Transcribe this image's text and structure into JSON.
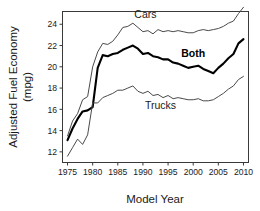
{
  "chart_data": {
    "type": "line",
    "title": "",
    "xlabel": "Model Year",
    "ylabel": "Adjusted Fuel Economy (mpg)",
    "ylabel_line1": "Adjusted Fuel Economy",
    "ylabel_line2": "(mpg)",
    "xlim": [
      1974,
      2011
    ],
    "ylim": [
      11,
      25.2
    ],
    "grid": false,
    "legend_position": "inline-annotations",
    "xticks": [
      1975,
      1980,
      1985,
      1990,
      1995,
      2000,
      2005,
      2010
    ],
    "xtick_labels": [
      "1975",
      "1980",
      "1985",
      "1990",
      "1995",
      "2000",
      "2005",
      "2010"
    ],
    "yticks": [
      12,
      14,
      16,
      18,
      20,
      22,
      24
    ],
    "ytick_labels": [
      "12",
      "14",
      "16",
      "18",
      "20",
      "22",
      "24"
    ],
    "x": [
      1975,
      1976,
      1977,
      1978,
      1979,
      1980,
      1981,
      1982,
      1983,
      1984,
      1985,
      1986,
      1987,
      1988,
      1989,
      1990,
      1991,
      1992,
      1993,
      1994,
      1995,
      1996,
      1997,
      1998,
      1999,
      2000,
      2001,
      2002,
      2003,
      2004,
      2005,
      2006,
      2007,
      2008,
      2009,
      2010
    ],
    "series": [
      {
        "name": "Cars",
        "label": "Cars",
        "color": "#4a4a4a",
        "emphasis": false,
        "values": [
          13.5,
          14.9,
          15.6,
          16.9,
          17.2,
          20.0,
          21.4,
          22.2,
          22.1,
          22.4,
          23.0,
          23.7,
          23.8,
          24.1,
          23.7,
          23.3,
          23.4,
          23.1,
          23.5,
          23.3,
          23.4,
          23.3,
          23.4,
          23.3,
          23.2,
          23.2,
          23.4,
          23.5,
          23.4,
          23.5,
          23.6,
          23.8,
          24.1,
          24.3,
          25.0,
          25.6
        ]
      },
      {
        "name": "Both",
        "label": "Both",
        "color": "#000000",
        "emphasis": true,
        "values": [
          13.1,
          14.2,
          15.1,
          15.8,
          15.9,
          16.2,
          19.9,
          21.1,
          21.0,
          21.2,
          21.3,
          21.6,
          21.8,
          22.0,
          21.7,
          21.2,
          21.3,
          21.0,
          20.9,
          20.7,
          20.7,
          20.4,
          20.3,
          20.1,
          19.9,
          20.0,
          20.1,
          19.8,
          19.6,
          19.4,
          19.9,
          20.3,
          20.8,
          21.2,
          22.2,
          22.6
        ]
      },
      {
        "name": "Trucks",
        "label": "Trucks",
        "color": "#4a4a4a",
        "emphasis": false,
        "values": [
          11.6,
          12.4,
          13.2,
          12.7,
          13.6,
          16.6,
          16.6,
          17.1,
          17.3,
          17.5,
          17.8,
          17.8,
          18.0,
          18.2,
          17.7,
          17.5,
          17.7,
          17.3,
          17.4,
          17.1,
          17.3,
          17.0,
          17.1,
          17.0,
          16.9,
          16.9,
          17.0,
          16.8,
          16.8,
          16.9,
          17.2,
          17.5,
          17.9,
          18.2,
          18.8,
          19.1
        ]
      }
    ],
    "annotations": [
      {
        "text": "Cars",
        "x": 1990.5,
        "y": 24.6
      },
      {
        "text": "Both",
        "x": 2000.0,
        "y": 20.9
      },
      {
        "text": "Trucks",
        "x": 1993.5,
        "y": 16.0
      }
    ]
  }
}
